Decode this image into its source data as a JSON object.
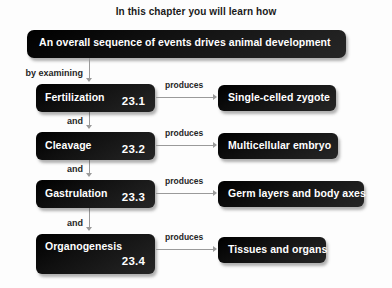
{
  "diagram": {
    "chapter_title": "In this chapter you will learn how",
    "header": {
      "label": "An overall sequence of events drives animal development"
    },
    "entry_connector": {
      "label": "by examining"
    },
    "between_connector_label": "and",
    "produces_label": "produces",
    "rows": [
      {
        "stage": "Fertilization",
        "section": "23.1",
        "result": "Single-celled zygote",
        "connector_in": "by examining",
        "produces": "produces"
      },
      {
        "stage": "Cleavage",
        "section": "23.2",
        "result": "Multicellular embryo",
        "connector_in": "and",
        "produces": "produces"
      },
      {
        "stage": "Gastrulation",
        "section": "23.3",
        "result": "Germ layers and body axes",
        "connector_in": "and",
        "produces": "produces"
      },
      {
        "stage": "Organogenesis",
        "section": "23.4",
        "result": "Tissues and organs",
        "connector_in": "and",
        "produces": "produces"
      }
    ],
    "colors": {
      "box_fill": "#121212",
      "box_text": "#ffffff",
      "background": "#fdfdfd",
      "connector": "#9a9a9a",
      "label_text": "#262626"
    }
  }
}
